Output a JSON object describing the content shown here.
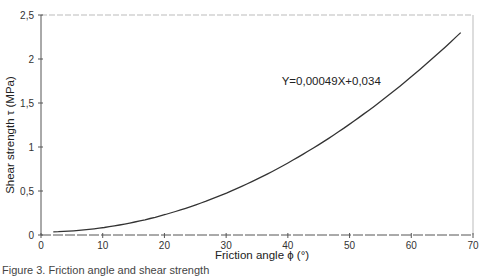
{
  "chart_data": {
    "type": "line",
    "title": "",
    "xlabel": "Friction angle ϕ (°)",
    "ylabel": "Shear strength  τ  (MPa)",
    "xlim": [
      0,
      70
    ],
    "ylim": [
      0,
      2.5
    ],
    "x_ticks": [
      0,
      10,
      20,
      30,
      40,
      50,
      60,
      70
    ],
    "x_tick_labels": [
      "0",
      "10",
      "20",
      "30",
      "40",
      "50",
      "60",
      "70"
    ],
    "y_ticks": [
      0,
      0.5,
      1,
      1.5,
      2,
      2.5
    ],
    "y_tick_labels": [
      "0",
      "0,5",
      "1",
      "1,5",
      "2",
      "2,5"
    ],
    "grid": false,
    "legend": null,
    "annotations": [
      {
        "text": "Y=0,00049X+0,034",
        "x": 39,
        "y": 1.7
      }
    ],
    "series": [
      {
        "name": "fit",
        "equation": "Y = 0.00049 X^2 + 0.034",
        "x": [
          2,
          5,
          10,
          15,
          20,
          25,
          30,
          35,
          40,
          45,
          50,
          55,
          60,
          65,
          68
        ],
        "values": [
          0.036,
          0.046,
          0.083,
          0.144,
          0.23,
          0.34,
          0.475,
          0.634,
          0.818,
          1.026,
          1.259,
          1.516,
          1.798,
          2.104,
          2.3
        ]
      }
    ]
  },
  "plot": {
    "left_px": 41,
    "right_px": 473,
    "top_px": 15,
    "bottom_px": 235,
    "line_color": "#333333",
    "axis_color": "#555555",
    "frame_color": "#bbbbbb"
  },
  "caption": "Figure 3. Friction angle and shear strength"
}
